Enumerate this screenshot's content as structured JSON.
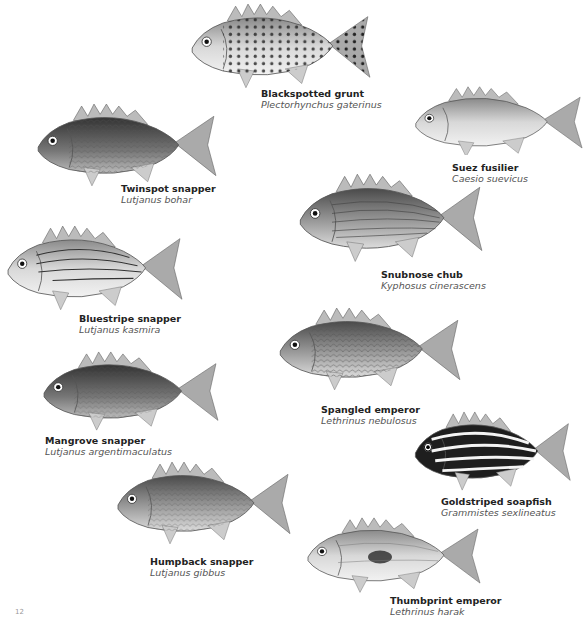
{
  "page": {
    "page_number": "12"
  },
  "species": [
    {
      "id": "blackspotted-grunt",
      "common": "Blackspotted grunt",
      "scientific": "Plectorhynchus gaterinus",
      "pattern": "spots"
    },
    {
      "id": "suez-fusilier",
      "common": "Suez fusilier",
      "scientific": "Caesio suevicus",
      "pattern": "plain"
    },
    {
      "id": "twinspot-snapper",
      "common": "Twinspot snapper",
      "scientific": "Lutjanus bohar",
      "pattern": "dark"
    },
    {
      "id": "snubnose-chub",
      "common": "Snubnose chub",
      "scientific": "Kyphosus cinerascens",
      "pattern": "lines"
    },
    {
      "id": "bluestripe-snapper",
      "common": "Bluestripe snapper",
      "scientific": "Lutjanus kasmira",
      "pattern": "stripes"
    },
    {
      "id": "spangled-emperor",
      "common": "Spangled emperor",
      "scientific": "Lethrinus nebulosus",
      "pattern": "scaled"
    },
    {
      "id": "mangrove-snapper",
      "common": "Mangrove snapper",
      "scientific": "Lutjanus argentimaculatus",
      "pattern": "dark"
    },
    {
      "id": "goldstriped-soapfish",
      "common": "Goldstriped soapfish",
      "scientific": "Grammistes sexlineatus",
      "pattern": "bold-stripes"
    },
    {
      "id": "humpback-snapper",
      "common": "Humpback snapper",
      "scientific": "Lutjanus gibbus",
      "pattern": "scaled"
    },
    {
      "id": "thumbprint-emperor",
      "common": "Thumbprint emperor",
      "scientific": "Lethrinus harak",
      "pattern": "blotch"
    }
  ],
  "colors": {
    "ink": "#222222",
    "scientific": "#555555",
    "fish_light": "#e6e6e6",
    "fish_mid": "#9a9a9a",
    "fish_dark": "#3a3a3a"
  }
}
